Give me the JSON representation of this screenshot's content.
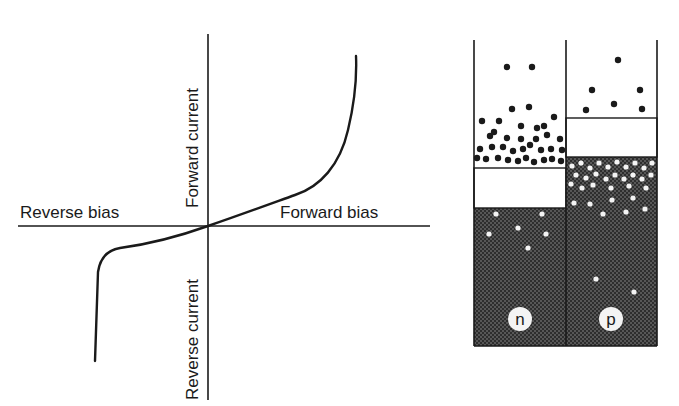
{
  "iv_curve": {
    "labels": {
      "reverse_bias": "Reverse bias",
      "forward_bias": "Forward bias",
      "forward_current": "Forward current",
      "reverse_current": "Reverse current"
    },
    "origin": [
      208,
      226
    ]
  },
  "band_diagram": {
    "columns": [
      {
        "id": "n",
        "label": "n"
      },
      {
        "id": "p",
        "label": "p"
      }
    ],
    "colors": {
      "outline": "#1a1a1a",
      "fill_dark": "#2b2b2b",
      "gap": "#ffffff",
      "electron": "#1a1a1a",
      "hole": "#f4f4f4"
    }
  }
}
